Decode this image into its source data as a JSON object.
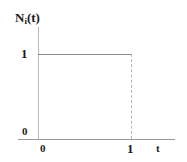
{
  "figure": {
    "background_color": "#ffffff",
    "axis_color": "#9a9a9a",
    "curve_color": "#8a8a8a",
    "dash_color": "#b5b5b5",
    "text_color": "#1c1c1c"
  },
  "labels": {
    "y_axis_title_main": "N",
    "y_axis_title_sub": "i",
    "y_axis_title_tail": "(t)",
    "y_tick_one": "1",
    "y_origin_zero": "0",
    "x_origin_zero": "0",
    "x_tick_one": "1",
    "x_axis_title": "t"
  },
  "chart_data": {
    "type": "line",
    "title": "",
    "xlabel": "t",
    "ylabel": "N_i(t)",
    "xlim": [
      0,
      1.45
    ],
    "ylim": [
      0,
      1.3
    ],
    "grid": false,
    "legend": null,
    "xticks": [
      0,
      1
    ],
    "xticklabels": [
      "0",
      "1"
    ],
    "yticks": [
      0,
      1
    ],
    "yticklabels": [
      "0",
      "1"
    ],
    "series": [
      {
        "name": "N_i(t)",
        "style": "step",
        "color": "#8a8a8a",
        "x": [
          0,
          1
        ],
        "y": [
          1,
          1
        ]
      },
      {
        "name": "drop-to-zero at t=1",
        "style": "dashed-vertical",
        "color": "#b5b5b5",
        "x": [
          1,
          1
        ],
        "y": [
          1,
          0
        ]
      }
    ],
    "annotations": [
      {
        "text": "step function equal to 1 on 0 ≤ t < 1 and 0 afterwards",
        "x": 0.5,
        "y": 1
      }
    ]
  }
}
